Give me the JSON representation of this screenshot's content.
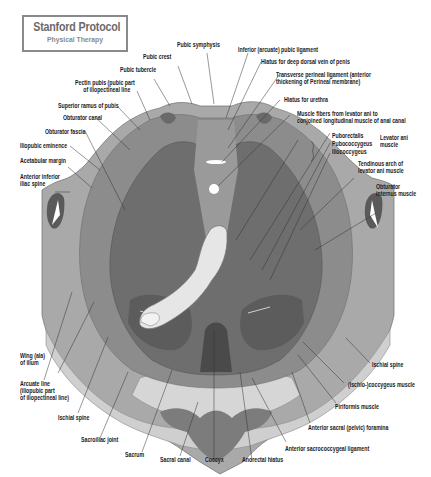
{
  "logo": {
    "title": "Stanford Protocol",
    "subtitle": "Physical Therapy"
  },
  "colors": {
    "background": "#ffffff",
    "bone_light": "#cfcfcf",
    "bone_mid": "#a9a9a9",
    "muscle_mid": "#8a8a8a",
    "muscle_dark": "#6a6a6a",
    "muscle_darker": "#555555",
    "finger": "#e6e6e6",
    "leader_line": "#333333"
  },
  "labels": {
    "pubic_symphysis": "Pubic symphysis",
    "pubic_crest": "Pubic crest",
    "pubic_tubercle": "Pubic tubercle",
    "pectin_pubis_1": "Pectin pubis (pubic part",
    "pectin_pubis_2": "of iliopectineal line",
    "superior_ramus": "Superior ramus of pubis",
    "obturator_canal": "Obturator canal",
    "obturator_fascia": "Obturator fascia",
    "iliopubic_eminence": "Iliopubic eminence",
    "acetabular_margin": "Acetabular margin",
    "anterior_inferior_iliac_1": "Anterior inferior",
    "anterior_inferior_iliac_2": "iliac spine",
    "inferior_pubic_ligament": "Inferior (arcuate) pubic ligament",
    "hiatus_dorsal_vein": "Hiatus for deep dorsal vein of penis",
    "transverse_perineal_1": "Transverse perineal ligament (anterior",
    "transverse_perineal_2": "thickening of Perineal membrane)",
    "hiatus_urethra": "Hiatus for urethra",
    "muscle_fibers_1": "Muscle fibers from levator ani to",
    "muscle_fibers_2": "conjoined longitudinal muscle of anal canal",
    "puborectalis": "Puborectalis",
    "pubococcygeus": "Pubococcygeus",
    "iliococcygeus": "Iliococcygeus",
    "levator_ani_1": "Levator ani",
    "levator_ani_2": "muscle",
    "tendinous_arch_1": "Tendinous arch of",
    "tendinous_arch_2": "levator ani muscle",
    "obturator_internus_1": "Obturator",
    "obturator_internus_2": "internus muscle",
    "wing_ilium_1": "Wing (ala)",
    "wing_ilium_2": "of ilium",
    "arcuate_line_1": "Arcuate line",
    "arcuate_line_2": "(iliopubic part",
    "arcuate_line_3": "of iliopectineal line)",
    "ischial_spine_left": "Ischial spine",
    "sacroiliac_joint": "Sacroiliac joint",
    "sacrum": "Sacrum",
    "sacral_canal": "Sacral canal",
    "coccyx": "Coccyx",
    "anorectal_hiatus": "Anorectal hiatus",
    "anterior_sacrococcygeal": "Anterior sacrococcygeal ligament",
    "anterior_sacral_foramina": "Anterior sacral (pelvic) foramina",
    "piriformis": "Piriformis muscle",
    "ischiococcygeus": "(Ischio-)coccygeus muscle",
    "ischial_spine_right": "Ischial spine"
  }
}
